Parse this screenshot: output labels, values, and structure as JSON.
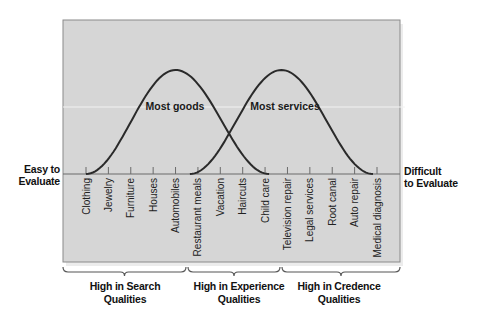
{
  "diagram": {
    "left_end_label": [
      "Easy to",
      "Evaluate"
    ],
    "right_end_label": [
      "Difficult",
      "to Evaluate"
    ],
    "curves": [
      {
        "label": "Most goods",
        "peak_at": "Automobiles",
        "span_from": "Clothing",
        "span_to": "Child care"
      },
      {
        "label": "Most services",
        "peak_at": "Television repair",
        "span_from": "Restaurant meals",
        "span_to": "Medical diagnosis"
      }
    ],
    "products": [
      "Clothing",
      "Jewelry",
      "Furniture",
      "Houses",
      "Automobiles",
      "Restaurant meals",
      "Vacation",
      "Haircuts",
      "Child care",
      "Television repair",
      "Legal services",
      "Root canal",
      "Auto repair",
      "Medical diagnosis"
    ],
    "groups": [
      {
        "label_line1": "High in Search",
        "label_line2": "Qualities",
        "from": "Clothing",
        "to": "Automobiles"
      },
      {
        "label_line1": "High in Experience",
        "label_line2": "Qualities",
        "from": "Restaurant meals",
        "to": "Child care"
      },
      {
        "label_line1": "High in Credence",
        "label_line2": "Qualities",
        "from": "Television repair",
        "to": "Medical diagnosis"
      }
    ],
    "colors": {
      "panel": "#d6d6d6",
      "panel_border": "#8a8a8a",
      "curve": "#2a2a2a",
      "text": "#111111"
    }
  }
}
